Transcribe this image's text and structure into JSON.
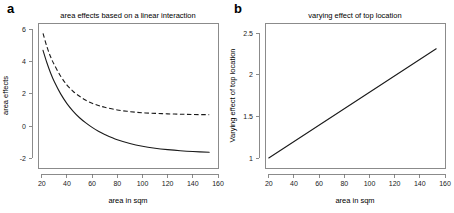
{
  "figure": {
    "background": "#ffffff",
    "axis_color": "#6e6e6e",
    "curve_color": "#1a1a1a"
  },
  "panels": [
    {
      "key": "a",
      "label": "a",
      "title": "area effects based on a linear interaction",
      "xlabel": "area in sqm",
      "ylabel": "area effects"
    },
    {
      "key": "b",
      "label": "b",
      "title": "varying effect of top location",
      "xlabel": "area in sqm",
      "ylabel": "Varying effect of top location"
    }
  ],
  "chart_data": [
    {
      "type": "line",
      "panel": "a",
      "title": "area effects based on a linear interaction",
      "xlabel": "area in sqm",
      "ylabel": "area effects",
      "xlim": [
        17,
        160
      ],
      "ylim": [
        -2.6,
        6.4
      ],
      "xticks": [
        20,
        40,
        60,
        80,
        100,
        120,
        140,
        160
      ],
      "yticks": [
        -2,
        0,
        2,
        4,
        6
      ],
      "grid": false,
      "legend": "none",
      "series": [
        {
          "name": "solid curve",
          "style": "solid",
          "x": [
            21,
            24,
            27,
            30,
            35,
            40,
            45,
            50,
            55,
            60,
            65,
            70,
            80,
            90,
            100,
            110,
            120,
            130,
            140,
            153
          ],
          "y": [
            4.7,
            3.95,
            3.3,
            2.75,
            2.0,
            1.4,
            0.92,
            0.52,
            0.2,
            -0.08,
            -0.32,
            -0.52,
            -0.85,
            -1.08,
            -1.25,
            -1.37,
            -1.46,
            -1.53,
            -1.58,
            -1.62
          ]
        },
        {
          "name": "dashed curve",
          "style": "dashed",
          "x": [
            21,
            24,
            27,
            30,
            35,
            40,
            45,
            50,
            55,
            60,
            65,
            70,
            80,
            90,
            100,
            110,
            120,
            130,
            140,
            153
          ],
          "y": [
            5.75,
            4.95,
            4.3,
            3.8,
            3.1,
            2.55,
            2.15,
            1.85,
            1.6,
            1.42,
            1.28,
            1.17,
            1.0,
            0.9,
            0.83,
            0.79,
            0.76,
            0.74,
            0.72,
            0.71
          ]
        }
      ]
    },
    {
      "type": "line",
      "panel": "b",
      "title": "varying effect of top location",
      "xlabel": "area in sqm",
      "ylabel": "Varying effect of top location",
      "xlim": [
        17,
        160
      ],
      "ylim": [
        0.88,
        2.62
      ],
      "xticks": [
        20,
        40,
        60,
        80,
        100,
        120,
        140,
        160
      ],
      "yticks": [
        1,
        1.5,
        2,
        2.5
      ],
      "grid": false,
      "legend": "none",
      "series": [
        {
          "name": "varying effect line",
          "style": "solid",
          "x": [
            20,
            153
          ],
          "y": [
            1.0,
            2.31
          ]
        }
      ]
    }
  ]
}
